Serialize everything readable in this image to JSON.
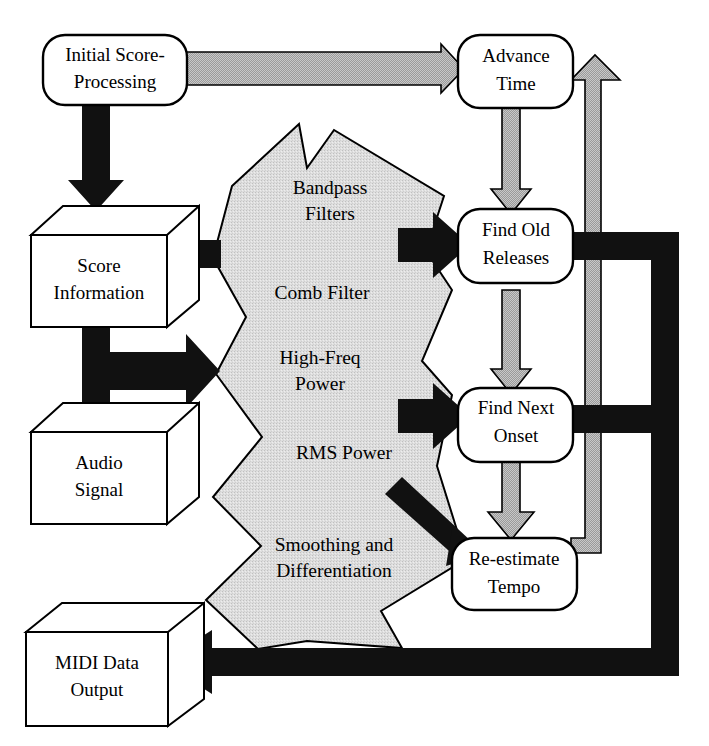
{
  "diagram": {
    "colors": {
      "background": "#ffffff",
      "outline": "#000000",
      "black_flow": "#111111",
      "gray_flow": "#8f8f8f",
      "gray_polygon_fill": "#dcdcdc",
      "box_fill": "#ffffff"
    },
    "rounded_nodes": [
      {
        "id": "initial-score-processing",
        "label_line1": "Initial Score-",
        "label_line2": "Processing"
      },
      {
        "id": "advance-time",
        "label_line1": "Advance",
        "label_line2": "Time"
      },
      {
        "id": "find-old-releases",
        "label_line1": "Find Old",
        "label_line2": "Releases"
      },
      {
        "id": "find-next-onset",
        "label_line1": "Find Next",
        "label_line2": "Onset"
      },
      {
        "id": "re-estimate-tempo",
        "label_line1": "Re-estimate",
        "label_line2": "Tempo"
      }
    ],
    "cube_nodes": [
      {
        "id": "score-information",
        "label_line1": "Score",
        "label_line2": "Information"
      },
      {
        "id": "audio-signal",
        "label_line1": "Audio",
        "label_line2": "Signal"
      },
      {
        "id": "midi-data-output",
        "label_line1": "MIDI Data",
        "label_line2": "Output"
      }
    ],
    "processing_stages": [
      {
        "id": "bandpass-filters",
        "label_line1": "Bandpass",
        "label_line2": "Filters"
      },
      {
        "id": "comb-filter",
        "label_line1": "Comb Filter",
        "label_line2": ""
      },
      {
        "id": "high-freq-power",
        "label_line1": "High-Freq",
        "label_line2": "Power"
      },
      {
        "id": "rms-power",
        "label_line1": "RMS Power",
        "label_line2": ""
      },
      {
        "id": "smoothing-and-differentiation",
        "label_line1": "Smoothing and",
        "label_line2": "Differentiation"
      }
    ],
    "flows": [
      {
        "id": "initial-to-advance-time",
        "style": "gray",
        "from": "initial-score-processing",
        "to": "advance-time"
      },
      {
        "id": "initial-to-score-information",
        "style": "black",
        "from": "initial-score-processing",
        "to": "score-information"
      },
      {
        "id": "advance-time-to-find-old-releases",
        "style": "gray",
        "from": "advance-time",
        "to": "find-old-releases"
      },
      {
        "id": "find-old-releases-to-find-next-onset",
        "style": "gray",
        "from": "find-old-releases",
        "to": "find-next-onset"
      },
      {
        "id": "find-next-onset-to-re-estimate-tempo",
        "style": "gray",
        "from": "find-next-onset",
        "to": "re-estimate-tempo"
      },
      {
        "id": "re-estimate-tempo-to-advance-time",
        "style": "gray",
        "from": "re-estimate-tempo",
        "to": "advance-time"
      },
      {
        "id": "processing-to-score-information",
        "style": "black",
        "from": "processing-block",
        "to": "score-information"
      },
      {
        "id": "score-information-to-processing",
        "style": "black",
        "from": "score-information",
        "to": "processing-block"
      },
      {
        "id": "audio-signal-to-processing",
        "style": "black",
        "from": "audio-signal",
        "to": "processing-block"
      },
      {
        "id": "processing-to-find-old-releases",
        "style": "black",
        "from": "processing-block",
        "to": "find-old-releases"
      },
      {
        "id": "processing-to-find-next-onset",
        "style": "black",
        "from": "processing-block",
        "to": "find-next-onset"
      },
      {
        "id": "processing-to-re-estimate-tempo",
        "style": "black",
        "from": "processing-block",
        "to": "re-estimate-tempo"
      },
      {
        "id": "find-old-releases-to-midi-output",
        "style": "black",
        "from": "find-old-releases",
        "to": "midi-data-output"
      },
      {
        "id": "find-next-onset-to-midi-output",
        "style": "black",
        "from": "find-next-onset",
        "to": "midi-data-output"
      }
    ]
  }
}
